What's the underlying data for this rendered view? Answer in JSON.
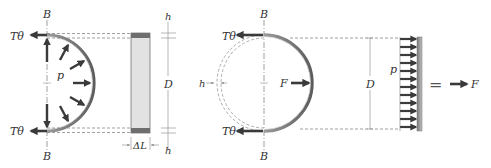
{
  "figure": {
    "colors": {
      "arrow": "#3a3a3a",
      "shell_dark": "#6a6a6a",
      "shell_light": "#c8c8c8",
      "wall_fill": "#e2e2e2",
      "dashed": "#777777",
      "axis": "#777777"
    },
    "left_panel": {
      "axis_label_top": "B",
      "axis_label_bottom": "B",
      "tension_top": "Tθ",
      "tension_bottom": "Tθ",
      "pressure": "p",
      "dimension_top": "h",
      "dimension_middle": "D",
      "dimension_bottom": "h",
      "length": "ΔL"
    },
    "middle_panel": {
      "axis_label_top": "B",
      "axis_label_bottom": "B",
      "tension_top": "Tθ",
      "tension_bottom": "Tθ",
      "force": "F",
      "thickness": "h"
    },
    "right_panel": {
      "dimension": "D",
      "pressure": "p",
      "equals": "=",
      "force": "F"
    }
  }
}
